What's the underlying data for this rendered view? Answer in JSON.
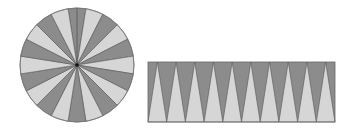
{
  "diagram": {
    "title": "",
    "colors": {
      "dark": "#8c8c8c",
      "light": "#d6d6d6",
      "stroke": "#555555",
      "center_dot": "#111111",
      "background": "#ffffff"
    },
    "circle": {
      "cx": 77,
      "cy": 65,
      "r": 57,
      "sectors": 20,
      "first_sector_color": "dark",
      "cut_line_at_top": true
    },
    "rectangle": {
      "x": 148,
      "y": 62,
      "width": 187,
      "height": 60,
      "light_triangles_up": 10,
      "dark_triangles_down": 9,
      "half_dark_triangles_at_ends": 2
    }
  }
}
